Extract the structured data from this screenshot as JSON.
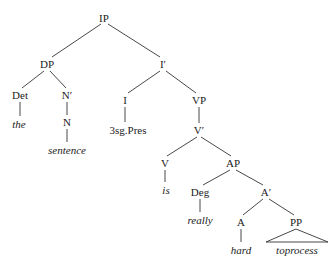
{
  "tree": {
    "nodes": [
      {
        "id": "IP",
        "label": "IP",
        "x": 104,
        "y": 18,
        "type": "category"
      },
      {
        "id": "DP",
        "label": "DP",
        "x": 47,
        "y": 64,
        "type": "category"
      },
      {
        "id": "Ibar",
        "label": "I′",
        "x": 163,
        "y": 64,
        "type": "category"
      },
      {
        "id": "Det",
        "label": "Det",
        "x": 20,
        "y": 95,
        "type": "category"
      },
      {
        "id": "Nbar",
        "label": "N′",
        "x": 67,
        "y": 95,
        "type": "category"
      },
      {
        "id": "I",
        "label": "I",
        "x": 125,
        "y": 100,
        "type": "category"
      },
      {
        "id": "VP",
        "label": "VP",
        "x": 199,
        "y": 100,
        "type": "category"
      },
      {
        "id": "the",
        "label": "the",
        "x": 19,
        "y": 124,
        "type": "word"
      },
      {
        "id": "N",
        "label": "N",
        "x": 67,
        "y": 122,
        "type": "category"
      },
      {
        "id": "agr",
        "label": "3sg.Pres",
        "x": 128,
        "y": 130,
        "type": "feature"
      },
      {
        "id": "Vbar",
        "label": "V′",
        "x": 199,
        "y": 130,
        "type": "category"
      },
      {
        "id": "sentence",
        "label": "sentence",
        "x": 67,
        "y": 150,
        "type": "word"
      },
      {
        "id": "V",
        "label": "V",
        "x": 165,
        "y": 163,
        "type": "category"
      },
      {
        "id": "AP",
        "label": "AP",
        "x": 233,
        "y": 163,
        "type": "category"
      },
      {
        "id": "is",
        "label": "is",
        "x": 166,
        "y": 190,
        "type": "word"
      },
      {
        "id": "Deg",
        "label": "Deg",
        "x": 200,
        "y": 192,
        "type": "category"
      },
      {
        "id": "Abar",
        "label": "A′",
        "x": 266,
        "y": 192,
        "type": "category"
      },
      {
        "id": "really",
        "label": "really",
        "x": 200,
        "y": 220,
        "type": "word"
      },
      {
        "id": "A",
        "label": "A",
        "x": 241,
        "y": 222,
        "type": "category"
      },
      {
        "id": "PP",
        "label": "PP",
        "x": 296,
        "y": 222,
        "type": "category"
      },
      {
        "id": "hard",
        "label": "hard",
        "x": 241,
        "y": 250,
        "type": "word"
      },
      {
        "id": "toprocess",
        "label": "toprocess",
        "x": 297,
        "y": 250,
        "type": "word"
      }
    ],
    "edges": [
      {
        "from": [
          101,
          24
        ],
        "to": [
          52,
          57
        ]
      },
      {
        "from": [
          108,
          24
        ],
        "to": [
          160,
          57
        ]
      },
      {
        "from": [
          44,
          71
        ],
        "to": [
          22,
          88
        ]
      },
      {
        "from": [
          50,
          71
        ],
        "to": [
          66,
          88
        ]
      },
      {
        "from": [
          67,
          102
        ],
        "to": [
          67,
          115
        ]
      },
      {
        "from": [
          20,
          102
        ],
        "to": [
          20,
          116
        ]
      },
      {
        "from": [
          160,
          71
        ],
        "to": [
          128,
          93
        ]
      },
      {
        "from": [
          166,
          71
        ],
        "to": [
          196,
          93
        ]
      },
      {
        "from": [
          125,
          107
        ],
        "to": [
          125,
          122
        ]
      },
      {
        "from": [
          199,
          107
        ],
        "to": [
          199,
          123
        ]
      },
      {
        "from": [
          67,
          129
        ],
        "to": [
          67,
          142
        ]
      },
      {
        "from": [
          197,
          137
        ],
        "to": [
          167,
          156
        ]
      },
      {
        "from": [
          201,
          137
        ],
        "to": [
          231,
          156
        ]
      },
      {
        "from": [
          165,
          170
        ],
        "to": [
          165,
          182
        ]
      },
      {
        "from": [
          230,
          170
        ],
        "to": [
          203,
          185
        ]
      },
      {
        "from": [
          236,
          170
        ],
        "to": [
          263,
          185
        ]
      },
      {
        "from": [
          200,
          199
        ],
        "to": [
          200,
          212
        ]
      },
      {
        "from": [
          263,
          199
        ],
        "to": [
          243,
          215
        ]
      },
      {
        "from": [
          269,
          199
        ],
        "to": [
          294,
          215
        ]
      },
      {
        "from": [
          241,
          229
        ],
        "to": [
          241,
          242
        ]
      }
    ],
    "triangle": {
      "apex": [
        296,
        229
      ],
      "left": [
        266,
        242
      ],
      "right": [
        328,
        242
      ]
    }
  }
}
